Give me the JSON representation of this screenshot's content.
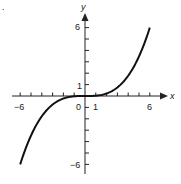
{
  "chart_data": {
    "type": "line",
    "title": "",
    "xlabel": "x",
    "ylabel": "y",
    "xlim": [
      -6,
      6
    ],
    "ylim": [
      -6,
      6
    ],
    "grid": false,
    "legend": null,
    "x_tick_labels": [
      "-6",
      "0",
      "1",
      "6"
    ],
    "y_tick_labels": [
      "6",
      "1",
      "-6"
    ],
    "x_ticks": [
      -6,
      -5,
      -4,
      -3,
      -2,
      -1,
      1,
      2,
      3,
      4,
      5,
      6
    ],
    "y_ticks": [
      -6,
      -5,
      -4,
      -3,
      -2,
      -1,
      1,
      2,
      3,
      4,
      5,
      6
    ],
    "series": [
      {
        "name": "y = x^3/36",
        "x": [
          -6,
          -5,
          -4,
          -3,
          -2,
          -1,
          0,
          1,
          2,
          3,
          4,
          5,
          6
        ],
        "y": [
          -6,
          -3.47,
          -1.78,
          -0.75,
          -0.22,
          -0.03,
          0,
          0.03,
          0.22,
          0.75,
          1.78,
          3.47,
          6
        ]
      }
    ]
  },
  "labels": {
    "x_axis": "x",
    "y_axis": "y",
    "x_neg6": "−6",
    "x_0": "0",
    "x_1": "1",
    "x_6": "6",
    "y_6": "6",
    "y_1": "1",
    "y_neg6": "−6",
    "corner_mark": "."
  }
}
